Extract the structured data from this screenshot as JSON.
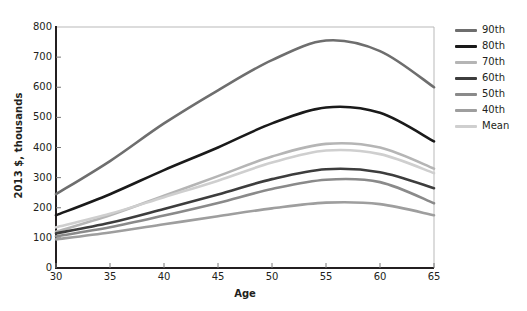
{
  "chart_data": {
    "type": "line",
    "title": "",
    "xlabel": "Age",
    "ylabel": "2013 $, thousands",
    "xlim": [
      30,
      65
    ],
    "ylim": [
      0,
      800
    ],
    "xticks": [
      "30",
      "35",
      "40",
      "45",
      "50",
      "55",
      "60",
      "65"
    ],
    "yticks": [
      "0",
      "100",
      "200",
      "300",
      "400",
      "500",
      "600",
      "700",
      "800"
    ],
    "grid": false,
    "legend_position": "right",
    "x": [
      30,
      35,
      40,
      45,
      50,
      55,
      60,
      65
    ],
    "series": [
      {
        "name": "90th",
        "color": "#6e6e6e",
        "values": [
          245,
          355,
          480,
          590,
          690,
          755,
          720,
          600
        ]
      },
      {
        "name": "80th",
        "color": "#1a1a1a",
        "values": [
          175,
          245,
          325,
          400,
          480,
          533,
          515,
          420
        ]
      },
      {
        "name": "70th",
        "color": "#b5b5b5",
        "values": [
          120,
          175,
          240,
          305,
          370,
          412,
          400,
          330
        ]
      },
      {
        "name": "60th",
        "color": "#3d3d3d",
        "values": [
          115,
          150,
          196,
          244,
          295,
          328,
          318,
          265
        ]
      },
      {
        "name": "50th",
        "color": "#8a8a8a",
        "values": [
          105,
          135,
          174,
          216,
          262,
          293,
          285,
          215
        ]
      },
      {
        "name": "40th",
        "color": "#9e9e9e",
        "values": [
          95,
          118,
          145,
          172,
          198,
          217,
          212,
          175
        ]
      },
      {
        "name": "Mean",
        "color": "#cfcfcf",
        "values": [
          135,
          180,
          235,
          290,
          350,
          390,
          378,
          315
        ]
      }
    ]
  },
  "axis": {
    "line_color": "#231f20",
    "top_border_color": "#b9b9b9"
  },
  "legend": {
    "items": [
      {
        "label": "90th",
        "color": "#6e6e6e"
      },
      {
        "label": "80th",
        "color": "#1a1a1a"
      },
      {
        "label": "70th",
        "color": "#b5b5b5"
      },
      {
        "label": "60th",
        "color": "#3d3d3d"
      },
      {
        "label": "50th",
        "color": "#8a8a8a"
      },
      {
        "label": "40th",
        "color": "#9e9e9e"
      },
      {
        "label": "Mean",
        "color": "#cfcfcf"
      }
    ]
  }
}
